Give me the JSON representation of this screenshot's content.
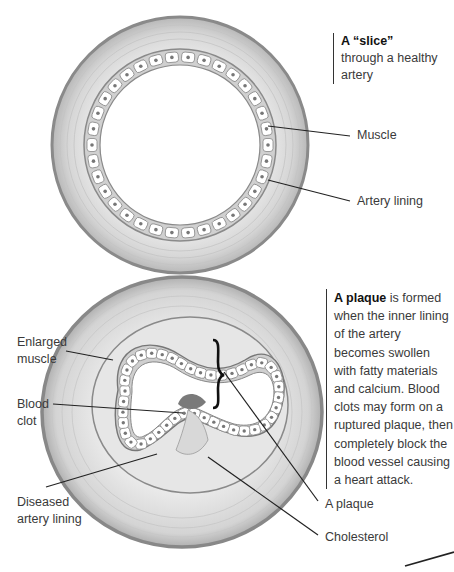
{
  "figure": {
    "top_diagram": {
      "caption_bold": "A “slice”",
      "caption_rest": "through a healthy artery",
      "labels": {
        "muscle": "Muscle",
        "artery_lining": "Artery lining"
      }
    },
    "bottom_diagram": {
      "caption_bold": "A plaque",
      "caption_rest": " is formed when the inner lining of the artery becomes swollen with fatty materials and calcium. Blood clots may form on a ruptured plaque, then completely block the blood vessel causing a heart attack.",
      "labels": {
        "enlarged_muscle_1": "Enlarged",
        "enlarged_muscle_2": "muscle",
        "blood_clot_1": "Blood",
        "blood_clot_2": "clot",
        "diseased_lining_1": "Diseased",
        "diseased_lining_2": "artery lining",
        "plaque": "A plaque",
        "cholesterol": "Cholesterol"
      }
    }
  }
}
